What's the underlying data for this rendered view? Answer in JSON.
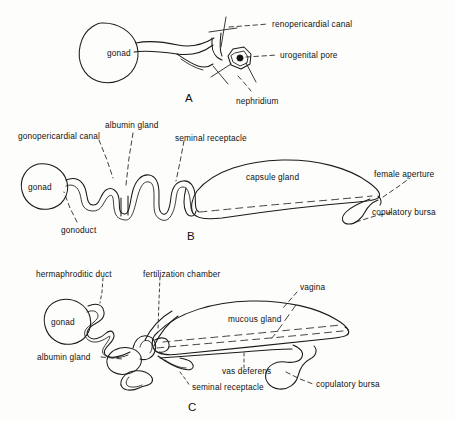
{
  "figure": {
    "background_color": "#fdfdfc",
    "ink_color": "#1a1a1a",
    "panel_count": 3
  },
  "panels": [
    {
      "letter": "A",
      "type": "dioecious-simple",
      "organ_labels": [
        {
          "text": "gonad",
          "placement": "inside-circle"
        }
      ],
      "callout_labels": [
        {
          "text": "renopericardial canal",
          "placement": "right"
        },
        {
          "text": "urogenital pore",
          "placement": "right"
        },
        {
          "text": "nephridium",
          "placement": "below"
        }
      ]
    },
    {
      "letter": "B",
      "type": "female-complex",
      "organ_labels": [
        {
          "text": "gonad",
          "placement": "inside-circle"
        },
        {
          "text": "capsule gland",
          "placement": "inside-leaf"
        }
      ],
      "callout_labels": [
        {
          "text": "gonopericardial canal",
          "placement": "above-left"
        },
        {
          "text": "albumin gland",
          "placement": "above"
        },
        {
          "text": "seminal receptacle",
          "placement": "above-right"
        },
        {
          "text": "female aperture",
          "placement": "right"
        },
        {
          "text": "copulatory bursa",
          "placement": "right-lower"
        },
        {
          "text": "gonoduct",
          "placement": "below-left"
        }
      ]
    },
    {
      "letter": "C",
      "type": "hermaphrodite-complex",
      "organ_labels": [
        {
          "text": "gonad",
          "placement": "inside-circle"
        },
        {
          "text": "mucous gland",
          "placement": "inside-leaf"
        }
      ],
      "callout_labels": [
        {
          "text": "hermaphroditic duct",
          "placement": "above-left"
        },
        {
          "text": "fertilization chamber",
          "placement": "above"
        },
        {
          "text": "vagina",
          "placement": "above-right"
        },
        {
          "text": "albumin gland",
          "placement": "left-lower"
        },
        {
          "text": "seminal receptacle",
          "placement": "below"
        },
        {
          "text": "vas deferens",
          "placement": "below"
        },
        {
          "text": "copulatory bursa",
          "placement": "right-lower"
        }
      ]
    }
  ],
  "labels": {
    "a_renopericardial_canal": "renopericardial canal",
    "a_urogenital_pore": "urogenital pore",
    "a_nephridium": "nephridium",
    "a_gonad": "gonad",
    "a_letter": "A",
    "b_gonopericardial_canal": "gonopericardial canal",
    "b_albumin_gland": "albumin gland",
    "b_seminal_receptacle": "seminal receptacle",
    "b_capsule_gland": "capsule gland",
    "b_female_aperture": "female aperture",
    "b_copulatory_bursa": "copulatory bursa",
    "b_gonoduct": "gonoduct",
    "b_gonad": "gonad",
    "b_letter": "B",
    "c_hermaphroditic_duct": "hermaphroditic duct",
    "c_fertilization_chamber": "fertilization chamber",
    "c_vagina": "vagina",
    "c_mucous_gland": "mucous gland",
    "c_albumin_gland": "albumin gland",
    "c_seminal_receptacle": "seminal receptacle",
    "c_vas_deferens": "vas deferens",
    "c_copulatory_bursa": "copulatory bursa",
    "c_gonad": "gonad",
    "c_letter": "C"
  }
}
